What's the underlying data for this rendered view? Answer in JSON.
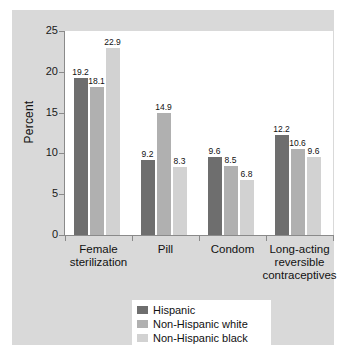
{
  "chart_data": {
    "type": "bar",
    "title": "",
    "subtitle": "",
    "xlabel": "",
    "ylabel": "Percent",
    "ylim": [
      0,
      25
    ],
    "yticks": [
      0,
      5,
      10,
      15,
      20,
      25
    ],
    "ytick_labels": [
      "0",
      "5",
      "10",
      "15",
      "20",
      "25"
    ],
    "grid": false,
    "legend_position": "bottom-center",
    "categories": [
      "Female sterilization",
      "Pill",
      "Condom",
      "Long-acting reversible contraceptives"
    ],
    "category_lines": [
      [
        "Female",
        "sterilization"
      ],
      [
        "Pill"
      ],
      [
        "Condom"
      ],
      [
        "Long-acting",
        "reversible",
        "contraceptives"
      ]
    ],
    "series": [
      {
        "name": "Hispanic",
        "color": "#6e6e6e",
        "values": [
          19.2,
          9.2,
          9.6,
          12.2
        ],
        "labels": [
          "19.2",
          "9.2",
          "9.6",
          "12.2"
        ]
      },
      {
        "name": "Non-Hispanic white",
        "color": "#b0b0b0",
        "values": [
          18.1,
          14.9,
          8.5,
          10.6
        ],
        "labels": [
          "18.1",
          "14.9",
          "8.5",
          "10.6"
        ]
      },
      {
        "name": "Non-Hispanic black",
        "color": "#d2d2d2",
        "values": [
          22.9,
          8.3,
          6.8,
          9.6
        ],
        "labels": [
          "22.9",
          "8.3",
          "6.8",
          "9.6"
        ]
      }
    ]
  },
  "colors": {
    "panel_background": "#d9d9d9",
    "plot_background": "#ffffff",
    "axis": "#8a8a8a",
    "text": "#111111",
    "series_1": "#6e6e6e",
    "series_2": "#b0b0b0",
    "series_3": "#d2d2d2"
  }
}
